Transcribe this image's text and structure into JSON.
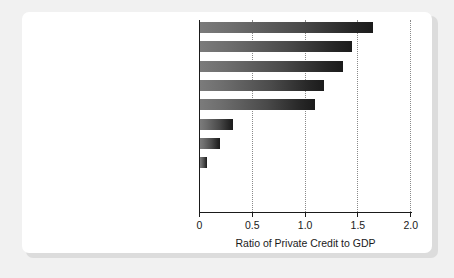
{
  "chart_data": {
    "type": "bar",
    "orientation": "horizontal",
    "title": "",
    "xlabel": "Ratio of Private Credit to GDP",
    "ylabel": "",
    "xlim": [
      0,
      2.0
    ],
    "xticks": [
      "0",
      "0.5",
      "1.0",
      "1.5",
      "2.0"
    ],
    "xtick_values": [
      0,
      0.5,
      1.0,
      1.5,
      2.0
    ],
    "grid": "vertical dotted gridlines at 0.5, 1.0, 1.5, 2.0",
    "legend": "none",
    "categories": [
      "United Kingdom",
      "Hong Kong",
      "New Zealand",
      "Germany",
      "Australia",
      "Egypt",
      "Burundi",
      "Cambodia",
      "Rwanda",
      "Lao People's Democratic Republic"
    ],
    "values": [
      1.64,
      1.44,
      1.35,
      1.17,
      1.09,
      0.31,
      0.19,
      0.07,
      0.0,
      0.0
    ]
  }
}
